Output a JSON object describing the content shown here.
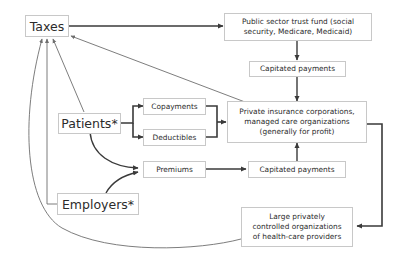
{
  "diagram": {
    "nodes": {
      "taxes": "Taxes",
      "trust_fund": "Public sector trust fund (social\nsecurity, Medicare, Medicaid)",
      "capitated_top": "Capitated payments",
      "private_insurance": "Private insurance corporations,\nmanaged care organizations\n(generally for profit)",
      "patients": "Patients*",
      "copayments": "Copayments",
      "deductibles": "Deductibles",
      "premiums": "Premiums",
      "capitated_bottom": "Capitated payments",
      "employers": "Employers*",
      "providers": "Large privately\ncontrolled organizations\nof health-care providers"
    },
    "edges": [
      {
        "from": "taxes",
        "to": "trust_fund"
      },
      {
        "from": "trust_fund",
        "to": "capitated_top"
      },
      {
        "from": "capitated_top",
        "to": "private_insurance"
      },
      {
        "from": "private_insurance",
        "to": "taxes"
      },
      {
        "from": "patients",
        "to": "copayments"
      },
      {
        "from": "patients",
        "to": "deductibles"
      },
      {
        "from": "copayments",
        "to": "private_insurance"
      },
      {
        "from": "deductibles",
        "to": "private_insurance"
      },
      {
        "from": "patients",
        "to": "premiums"
      },
      {
        "from": "employers",
        "to": "premiums"
      },
      {
        "from": "premiums",
        "to": "capitated_bottom"
      },
      {
        "from": "capitated_bottom",
        "to": "private_insurance"
      },
      {
        "from": "private_insurance",
        "to": "providers"
      },
      {
        "from": "patients",
        "to": "taxes"
      },
      {
        "from": "employers",
        "to": "taxes"
      },
      {
        "from": "providers",
        "to": "taxes"
      }
    ],
    "colors": {
      "box_border": "#c8c8c8",
      "thick_edge": "#3a3a3a",
      "thin_edge": "#6e6e6e",
      "text": "#2b2b2b"
    }
  }
}
